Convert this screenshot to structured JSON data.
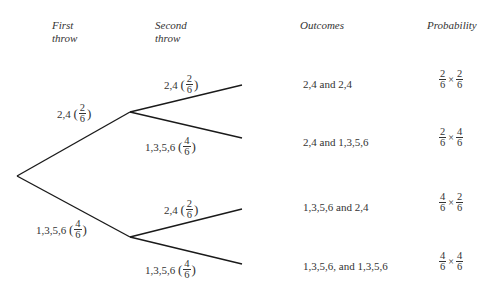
{
  "headers": {
    "first_throw": [
      "First",
      "throw"
    ],
    "second_throw": [
      "Second",
      "throw"
    ],
    "outcomes": "Outcomes",
    "probability": "Probability"
  },
  "first_branches": [
    {
      "label": "2,4",
      "num": "2",
      "den": "6"
    },
    {
      "label": "1,3,5,6",
      "num": "4",
      "den": "6"
    }
  ],
  "second_branches": [
    {
      "label": "2,4",
      "num": "2",
      "den": "6"
    },
    {
      "label": "1,3,5,6",
      "num": "4",
      "den": "6"
    },
    {
      "label": "2,4",
      "num": "2",
      "den": "6"
    },
    {
      "label": "1,3,5,6",
      "num": "4",
      "den": "6"
    }
  ],
  "outcomes": [
    "2,4 and 2,4",
    "2,4 and 1,3,5,6",
    "1,3,5,6 and 2,4",
    "1,3,5,6, and 1,3,5,6"
  ],
  "probabilities": [
    {
      "a_num": "2",
      "a_den": "6",
      "op": "×",
      "b_num": "2",
      "b_den": "6"
    },
    {
      "a_num": "2",
      "a_den": "6",
      "op": "×",
      "b_num": "4",
      "b_den": "6"
    },
    {
      "a_num": "4",
      "a_den": "6",
      "op": "×",
      "b_num": "2",
      "b_den": "6"
    },
    {
      "a_num": "4",
      "a_den": "6",
      "op": "×",
      "b_num": "4",
      "b_den": "6"
    }
  ],
  "line_color": "#1a1a1a"
}
